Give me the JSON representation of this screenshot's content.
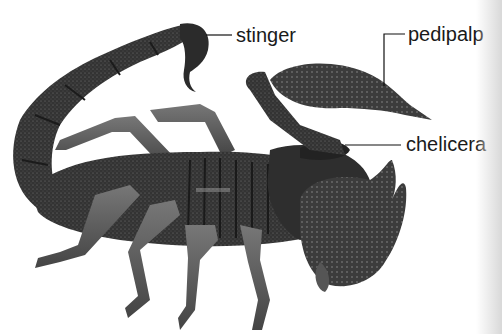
{
  "figure": {
    "labels": [
      {
        "id": "stinger",
        "text": "stinger",
        "x": 236,
        "y": 26,
        "line": [
          [
            206,
            35
          ],
          [
            232,
            35
          ]
        ]
      },
      {
        "id": "pedipalp",
        "text": "pedipalp",
        "x": 408,
        "y": 25,
        "line": [
          [
            384,
            86
          ],
          [
            384,
            34
          ],
          [
            405,
            34
          ]
        ]
      },
      {
        "id": "chelicera",
        "text": "chelicera",
        "x": 406,
        "y": 134,
        "line": [
          [
            345,
            145
          ],
          [
            401,
            145
          ]
        ]
      }
    ]
  },
  "colors": {
    "background": "#ffffff",
    "body_dark": "#2a2a2a",
    "body_mid": "#4a4a4a",
    "leg": "#6a6a6a",
    "label_text": "#1a1a1a"
  }
}
